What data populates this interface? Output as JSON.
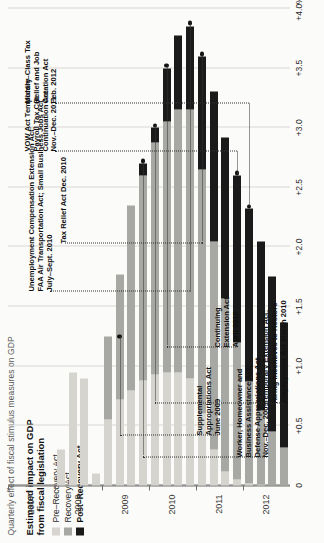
{
  "figure": {
    "kicker": "Quarterly effect of fiscal stimulus measures on GDP",
    "legend_title_line1": "Estimated impact on GDP",
    "legend_title_line2": "from fiscal legislation"
  },
  "legend": {
    "items": [
      {
        "label": "Pre–Recovery Act",
        "color": "#d5d4cf",
        "bold": false
      },
      {
        "label": "Recovery Act",
        "color": "#a7a7a3",
        "bold": false
      },
      {
        "label": "Post–Recovery Act",
        "color": "#1a1a1a",
        "bold": true
      }
    ]
  },
  "annotations": [
    {
      "id": "supplemental-appropriations",
      "lines": "Supplemental\nAppropriations Act\nJune 2009"
    },
    {
      "id": "worker-homeowner-business",
      "lines": "Worker, Homeowner and\nBusiness Assistance Act;\nDefense Appropriations Act\nNov.–Dec. 2009"
    },
    {
      "id": "temporary-extension-hiring-incentives",
      "lines": "Temporary Extension Act;\nHiring Incentives to Restore\nEmployment Act  March 2010"
    },
    {
      "id": "continuing-extension",
      "lines": "Continuing\nExtension Act\nApril 2010"
    },
    {
      "id": "unemployment-faa",
      "lines": "Unemployment Compensation Extension Act;\nFAA Air Transportation Act; Small Business Jobs Act\nJuly–Sept. 2010"
    },
    {
      "id": "tax-relief",
      "lines": "Tax Relief Act  Dec. 2010"
    },
    {
      "id": "vow-act",
      "lines": "VOW Act Temporary\nPayroll Tax Cut\nContinuation Act\nNov.–Dec. 2011"
    },
    {
      "id": "middle-class-tax",
      "lines": "Middle–Class Tax\nRelief and Job\nCreation Act\nFeb. 2012"
    }
  ],
  "chart_data": {
    "type": "bar",
    "orientation": "horizontal-rotated",
    "title": "Quarterly effect of fiscal stimulus measures on GDP",
    "xlabel": "",
    "ylabel": "",
    "grid": true,
    "legend_position": "top-left",
    "value_axis": {
      "ticks": [
        "0",
        "+0.5",
        "+1.0",
        "+1.5",
        "+2.0",
        "+2.5",
        "+3.0",
        "+3.5",
        "+4.0%"
      ],
      "values": [
        0,
        0.5,
        1.0,
        1.5,
        2.0,
        2.5,
        3.0,
        3.5,
        4.0
      ],
      "lim": [
        0,
        4.0
      ],
      "unit": "% of GDP"
    },
    "time_axis": {
      "year_labels": [
        "2007",
        "2008",
        "2009",
        "2010",
        "2011",
        "2012"
      ],
      "quarters": [
        "2007 Q1",
        "2007 Q2",
        "2007 Q3",
        "2007 Q4",
        "2008 Q1",
        "2008 Q2",
        "2008 Q3",
        "2008 Q4",
        "2009 Q1",
        "2009 Q2",
        "2009 Q3",
        "2009 Q4",
        "2010 Q1",
        "2010 Q2",
        "2010 Q3",
        "2010 Q4",
        "2011 Q1",
        "2011 Q2",
        "2011 Q3",
        "2011 Q4",
        "2012 Q1",
        "2012 Q2",
        "2012 Q3",
        "2012 Q4"
      ]
    },
    "series": [
      {
        "name": "Pre–Recovery Act",
        "color": "#d5d4cf",
        "values": [
          0,
          0,
          0,
          0,
          0.3,
          0.95,
          0.9,
          0.1,
          0.55,
          0.72,
          0.8,
          0.88,
          0.93,
          0.95,
          0.95,
          0.9,
          0.6,
          0.3,
          0.12,
          0.05,
          0.02,
          0.01,
          0,
          0
        ]
      },
      {
        "name": "Recovery Act",
        "color": "#a7a7a3",
        "values": [
          0,
          0,
          0,
          0,
          0,
          0,
          0,
          0,
          0.7,
          1.05,
          1.55,
          1.72,
          1.95,
          2.1,
          2.2,
          2.25,
          2.05,
          1.75,
          1.45,
          1.15,
          0.85,
          0.62,
          0.45,
          0.32
        ]
      },
      {
        "name": "Post–Recovery Act",
        "color": "#1a1a1a",
        "values": [
          0,
          0,
          0,
          0,
          0,
          0,
          0,
          0,
          0,
          0,
          0,
          0.1,
          0.12,
          0.45,
          0.62,
          0.7,
          0.95,
          1.25,
          1.35,
          1.4,
          1.45,
          1.42,
          1.3,
          1.05
        ]
      }
    ],
    "totals": [
      0,
      0,
      0,
      0,
      0.3,
      0.95,
      0.9,
      0.1,
      1.25,
      1.77,
      2.35,
      2.7,
      3.0,
      3.5,
      3.77,
      3.85,
      3.6,
      3.3,
      2.92,
      2.6,
      2.32,
      2.05,
      1.75,
      1.37
    ]
  }
}
